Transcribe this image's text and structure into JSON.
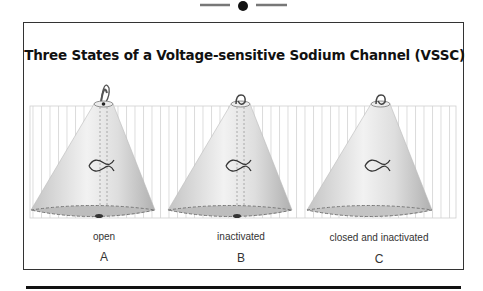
{
  "title": "Three States of a Voltage-sensitive Sodium Channel (VSSC)",
  "channels": [
    {
      "state": "open",
      "letter": "A",
      "gate": "open-loop"
    },
    {
      "state": "inactivated",
      "letter": "B",
      "gate": "knotted-loop"
    },
    {
      "state": "closed and inactivated",
      "letter": "C",
      "gate": "knotted-loop"
    }
  ],
  "colors": {
    "frame": "#333333",
    "membrane_stripe": "#d0d0d0",
    "cone_light": "#f4f4f4",
    "cone_dark": "#b8b8b8",
    "base": "#bdbdbd"
  }
}
